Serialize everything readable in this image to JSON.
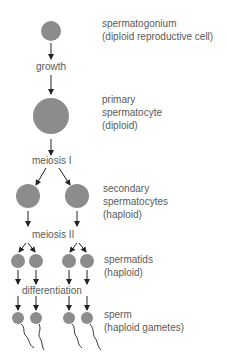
{
  "diagram": {
    "colors": {
      "cell": "#8c8c8c",
      "arrow": "#222222",
      "text": "#5a5a5a"
    },
    "stages": [
      {
        "id": "spermatogonium",
        "line1": "spermatogonium",
        "line2": "(diploid reproductive cell)"
      },
      {
        "id": "primary",
        "line1": "primary",
        "line2": "spermatocyte",
        "line3": "(diploid)"
      },
      {
        "id": "secondary",
        "line1": "secondary",
        "line2": "spermatocytes",
        "line3": "(haploid)"
      },
      {
        "id": "spermatids",
        "line1": "spermatids",
        "line2": "(haploid)"
      },
      {
        "id": "sperm",
        "line1": "sperm",
        "line2": "(haploid gametes)"
      }
    ],
    "processes": [
      {
        "id": "growth",
        "label": "growth"
      },
      {
        "id": "meiosis1",
        "label": "meiosis I"
      },
      {
        "id": "meiosis2",
        "label": "meiosis II"
      },
      {
        "id": "differentiation",
        "label": "differentiation"
      }
    ]
  }
}
